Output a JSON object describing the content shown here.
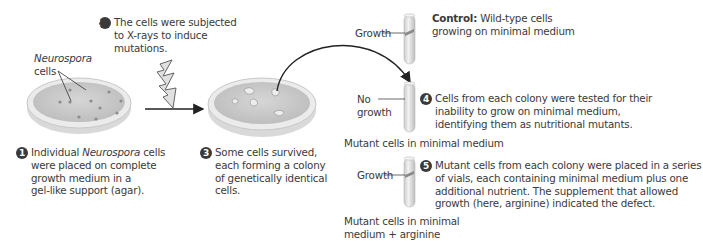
{
  "steps": [
    {
      "number": "1",
      "text_pre": "Individual ",
      "text_italic": "Neurospora",
      "text_post": " cells were placed on complete growth medium in a gel-like support (agar).",
      "lines": [
        "Individual |Neurospora| cells",
        "were placed on complete",
        "growth medium in a",
        "gel-like support (agar)."
      ]
    },
    {
      "number": "2",
      "lines": [
        "The cells were subjected",
        "to X-rays to induce",
        "mutations."
      ]
    },
    {
      "number": "3",
      "lines": [
        "Some cells survived,",
        "each forming a colony",
        "of genetically identical",
        "cells."
      ]
    },
    {
      "number": "4",
      "lines": [
        "Cells from each colony were tested for their",
        "inability to grow on minimal medium,",
        "identifying them as nutritional mutants."
      ]
    },
    {
      "number": "5",
      "lines": [
        "Mutant cells from each colony were placed in a series",
        "of vials, each containing minimal medium plus one",
        "additional nutrient. The supplement that allowed",
        "growth (here, arginine) indicated the defect."
      ]
    }
  ],
  "labels": {
    "neurospora": "Neurospora",
    "cells": "cells",
    "growth_top": "Growth",
    "no": "No",
    "growth_word": "growth",
    "growth_bottom": "Growth",
    "control_bold": "Control:",
    "control_rest_1": "Wild-type cells",
    "control_rest_2": "growing on minimal medium",
    "mutant_minimal": "Mutant cells in minimal medium",
    "mutant_arginine_1": "Mutant cells in minimal",
    "mutant_arginine_2": "medium + arginine"
  },
  "colors": {
    "dish_fill": "#cfcfcf",
    "dish_rim": "#e6e6e6",
    "tube": "#d8d8d8",
    "growth_band": "#8a8a8a",
    "number_badge": "#3a3a3a",
    "text": "#3a3a3a"
  },
  "icons": [
    "petri-dish-icon",
    "xray-lightning-icon",
    "arrow-icon",
    "test-tube-icon",
    "curved-arrow-icon"
  ]
}
